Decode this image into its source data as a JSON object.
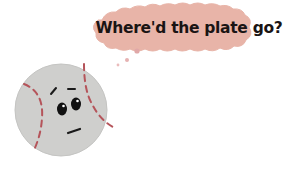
{
  "illustration": {
    "speech_bubble": {
      "text": "Where'd the plate go?",
      "fill_color": "#e8b4a8",
      "text_color": "#1a1414"
    },
    "character": {
      "type": "baseball",
      "expression": "worried",
      "ball_color": "#cfcfcd",
      "stitch_color": "#b5545a",
      "eye_color": "#111111",
      "mouth_color": "#1a1a1a"
    },
    "thought_dots_color": "#e0a8a8",
    "background_color": "#ffffff"
  }
}
